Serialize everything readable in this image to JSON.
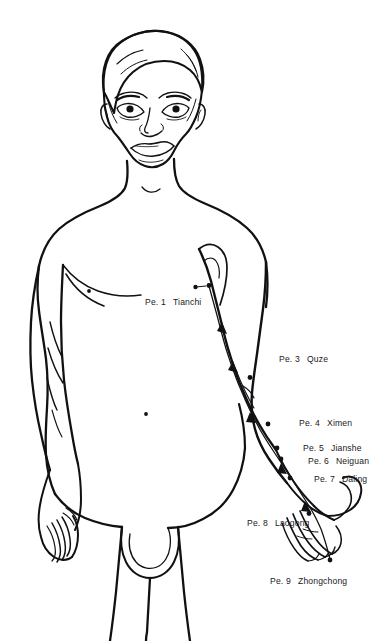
{
  "figure": {
    "stroke_color": "#111114",
    "background_color": "#ffffff",
    "point_marker_color": "#111114",
    "label_color": "#19191c"
  },
  "points": [
    {
      "code": "Pe. 1",
      "name": "Tianchi",
      "label_x": 145,
      "label_y": 298,
      "dot_x": 209,
      "dot_y": 285.5,
      "leader": true
    },
    {
      "code": "Pe. 3",
      "name": "Quze",
      "label_x": 279,
      "label_y": 355,
      "dot_x": 250,
      "dot_y": 377.5,
      "leader": false
    },
    {
      "code": "Pe. 4",
      "name": "Ximen",
      "label_x": 299,
      "label_y": 419,
      "dot_x": 268,
      "dot_y": 424.0,
      "leader": false
    },
    {
      "code": "Pe. 5",
      "name": "Jianshe",
      "label_x": 303,
      "label_y": 444,
      "dot_x": 277,
      "dot_y": 448.0,
      "leader": false
    },
    {
      "code": "Pe. 6",
      "name": "Neiguan",
      "label_x": 308,
      "label_y": 457,
      "dot_x": 281,
      "dot_y": 459.0,
      "leader": false
    },
    {
      "code": "Pe. 7",
      "name": "Daling",
      "label_x": 314,
      "label_y": 475,
      "dot_x": 290,
      "dot_y": 478.0,
      "leader": false
    },
    {
      "code": "Pe. 8",
      "name": "Laogong",
      "label_x": 247,
      "label_y": 519,
      "dot_x": 309,
      "dot_y": 513.5,
      "leader": false
    },
    {
      "code": "Pe. 9",
      "name": "Zhongchong",
      "label_x": 270,
      "label_y": 577,
      "dot_x": 330,
      "dot_y": 560.0,
      "leader": false
    }
  ],
  "body_marks": [
    {
      "name": "left-nipple",
      "x": 89,
      "y": 291
    },
    {
      "name": "navel",
      "x": 146,
      "y": 414
    }
  ],
  "meridian": {
    "name": "Pericardium channel of the hand Jueyin",
    "flow_direction": "from chest to fingertip",
    "arrow_count": 5
  }
}
